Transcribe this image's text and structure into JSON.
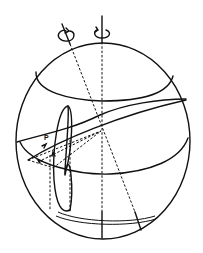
{
  "figure": {
    "type": "sphere-rotation-diagram",
    "labels": {
      "point_p": "P"
    },
    "axes": [
      {
        "name": "vertical-rotation-axis",
        "rotation_indicator": "circular-arrow"
      },
      {
        "name": "tilted-rotation-axis",
        "rotation_indicator": "circular-arrow"
      }
    ],
    "colors": {
      "ink": "#111111",
      "background": "#ffffff"
    }
  }
}
